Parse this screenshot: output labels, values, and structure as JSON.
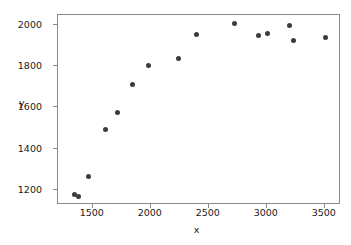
{
  "chart_data": {
    "type": "scatter",
    "title": "",
    "xlabel": "x",
    "ylabel": "y",
    "xlim": [
      1200,
      3640
    ],
    "ylim": [
      1125,
      2050
    ],
    "xticks": [
      1500,
      2000,
      2500,
      3000,
      3500
    ],
    "yticks": [
      1200,
      1400,
      1600,
      1800,
      2000
    ],
    "xtick_labels": [
      "1500",
      "2000",
      "2500",
      "3000",
      "3500"
    ],
    "ytick_labels": [
      "1200",
      "1400",
      "1600",
      "1800",
      "2000"
    ],
    "grid": false,
    "legend": null,
    "marker_color": "#3c3c3c",
    "marker_size": 5,
    "points": [
      {
        "x": 1342,
        "y": 1175
      },
      {
        "x": 1380,
        "y": 1166
      },
      {
        "x": 1462,
        "y": 1262
      },
      {
        "x": 1607,
        "y": 1492
      },
      {
        "x": 1712,
        "y": 1575
      },
      {
        "x": 1843,
        "y": 1712
      },
      {
        "x": 1977,
        "y": 1803
      },
      {
        "x": 2238,
        "y": 1838
      },
      {
        "x": 2398,
        "y": 1955
      },
      {
        "x": 2723,
        "y": 2008
      },
      {
        "x": 2933,
        "y": 1950
      },
      {
        "x": 3005,
        "y": 1958
      },
      {
        "x": 3197,
        "y": 2000
      },
      {
        "x": 3230,
        "y": 1925
      },
      {
        "x": 3505,
        "y": 1942
      }
    ]
  },
  "figure": {
    "background": "#ffffff",
    "axes_edge_color": "#8a8a8a"
  }
}
